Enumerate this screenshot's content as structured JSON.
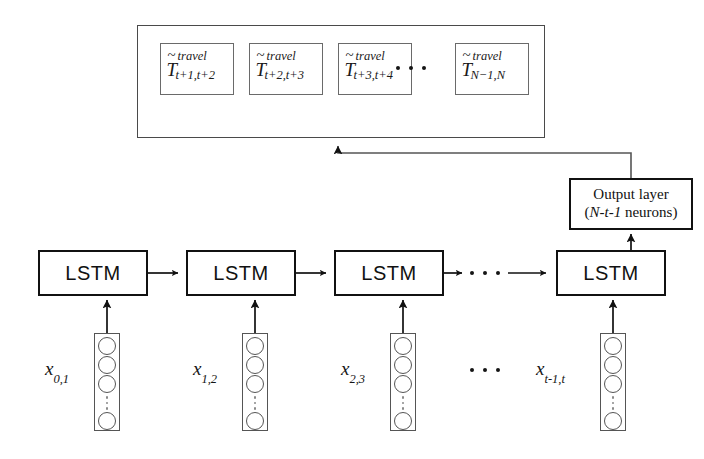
{
  "diagram": {
    "output_container": {
      "name": "predicted-travel-times-container",
      "boxes": [
        {
          "base": "T",
          "accent": "~",
          "superscript": "travel",
          "subscript": "t+1,t+2"
        },
        {
          "base": "T",
          "accent": "~",
          "superscript": "travel",
          "subscript": "t+2,t+3"
        },
        {
          "base": "T",
          "accent": "~",
          "superscript": "travel",
          "subscript": "t+3,t+4"
        },
        {
          "base": "T",
          "accent": "~",
          "superscript": "travel",
          "subscript": "N−1,N"
        }
      ],
      "ellipsis": "• • •"
    },
    "output_layer": {
      "line1": "Output layer",
      "line2_prefix": "(",
      "line2_italic": "N-t-1",
      "line2_suffix": " neurons)",
      "line2_full": "(N-t-1 neurons)"
    },
    "lstm_cells": [
      {
        "label": "LSTM"
      },
      {
        "label": "LSTM"
      },
      {
        "label": "LSTM"
      },
      {
        "label": "LSTM"
      }
    ],
    "lstm_chain_ellipsis": "• • •",
    "inputs": [
      {
        "base": "x",
        "subscript": "0,1",
        "nodes_top": 3,
        "nodes_bottom": 1
      },
      {
        "base": "x",
        "subscript": "1,2",
        "nodes_top": 3,
        "nodes_bottom": 1
      },
      {
        "base": "x",
        "subscript": "2,3",
        "nodes_top": 3,
        "nodes_bottom": 1
      },
      {
        "base": "x",
        "subscript": "t-1,t",
        "nodes_top": 3,
        "nodes_bottom": 1
      }
    ],
    "input_ellipsis": "• • •",
    "colors": {
      "background": "#ffffff",
      "thick_stroke": "#111111",
      "thin_stroke": "#555555",
      "container_stroke": "#4a4a4a",
      "text": "#141414"
    }
  }
}
